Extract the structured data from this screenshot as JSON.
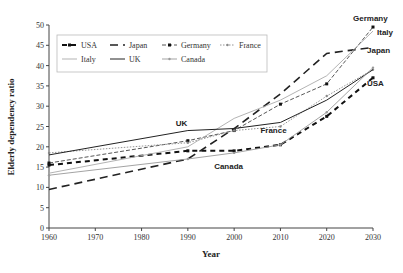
{
  "chart_data": {
    "type": "line",
    "title": "",
    "xlabel": "Year",
    "ylabel": "Elderly dependency ratio",
    "x_ticks": [
      "1960",
      "1970",
      "1980",
      "1990",
      "2000",
      "2010",
      "2020",
      "2030"
    ],
    "y_ticks": [
      "0",
      "5",
      "10",
      "15",
      "20",
      "25",
      "30",
      "35",
      "40",
      "45",
      "50"
    ],
    "xlim": [
      1960,
      2030
    ],
    "ylim": [
      0,
      50
    ],
    "grid": false,
    "legend_position": "top-left inside",
    "x": [
      1960,
      1990,
      2000,
      2010,
      2020,
      2030
    ],
    "series": [
      {
        "name": "USA",
        "values": [
          15.5,
          19,
          19,
          20.5,
          27.5,
          37
        ],
        "style": "thick-dash-marker"
      },
      {
        "name": "Japan",
        "values": [
          9.5,
          17,
          24.5,
          33,
          43,
          44.5
        ],
        "style": "long-dash"
      },
      {
        "name": "Germany",
        "values": [
          16,
          21.5,
          24,
          30.5,
          35.5,
          49.5
        ],
        "style": "dash-square-marker"
      },
      {
        "name": "France",
        "values": [
          18.5,
          21,
          24,
          25,
          32.5,
          39
        ],
        "style": "dotted-marker"
      },
      {
        "name": "Italy",
        "values": [
          13.5,
          20,
          27,
          31.5,
          37.5,
          48.5
        ],
        "style": "thin-grey"
      },
      {
        "name": "UK",
        "values": [
          18,
          24,
          24.5,
          26,
          31.5,
          39
        ],
        "style": "solid-dark"
      },
      {
        "name": "Canada",
        "values": [
          13,
          17,
          18.5,
          20.5,
          28.5,
          39.5
        ],
        "style": "grey-marker"
      }
    ],
    "annotations": [
      {
        "text": "Germany",
        "x": 2030,
        "y": 50.5
      },
      {
        "text": "Italy",
        "x": 2030,
        "y": 48
      },
      {
        "text": "Japan",
        "x": 2030,
        "y": 43
      },
      {
        "text": "USA",
        "x": 2030,
        "y": 35
      },
      {
        "text": "UK",
        "x": 1990,
        "y": 25
      },
      {
        "text": "France",
        "x": 2010,
        "y": 23.5
      },
      {
        "text": "Canada",
        "x": 2000,
        "y": 16
      }
    ]
  },
  "legend": [
    {
      "label": "USA"
    },
    {
      "label": "Japan"
    },
    {
      "label": "Germany"
    },
    {
      "label": "France"
    },
    {
      "label": "Italy"
    },
    {
      "label": "UK"
    },
    {
      "label": "Canada"
    }
  ],
  "labels": {
    "xlabel": "Year",
    "ylabel": "Elderly dependency ratio"
  }
}
